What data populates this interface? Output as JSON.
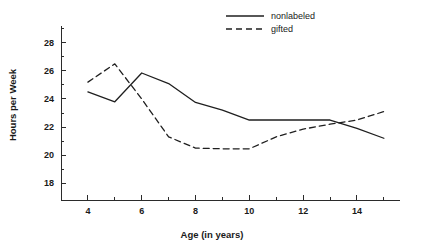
{
  "chart_data": {
    "type": "line",
    "title": "",
    "xlabel": "Age (in years)",
    "ylabel": "Hours per Week",
    "xlim": [
      3,
      15.6
    ],
    "ylim": [
      16.8,
      29.2
    ],
    "grid": false,
    "legend_position": "top-right",
    "x": [
      4,
      5,
      6,
      7,
      8,
      9,
      10,
      11,
      12,
      13,
      14,
      15
    ],
    "xticks": [
      4,
      5,
      6,
      7,
      8,
      9,
      10,
      11,
      12,
      13,
      14,
      15
    ],
    "xtick_labels": [
      "4",
      "",
      "6",
      "",
      "8",
      "",
      "10",
      "",
      "12",
      "",
      "14",
      ""
    ],
    "yticks": [
      18,
      19,
      20,
      21,
      22,
      23,
      24,
      25,
      26,
      27,
      28,
      29
    ],
    "ytick_labels": [
      "18",
      "",
      "20",
      "",
      "22",
      "",
      "24",
      "",
      "26",
      "",
      "28",
      ""
    ],
    "series": [
      {
        "name": "nonlabeled",
        "style": "solid",
        "values": [
          24.5,
          23.8,
          25.85,
          25.1,
          23.75,
          23.2,
          22.5,
          22.5,
          22.5,
          22.5,
          21.9,
          21.2
        ]
      },
      {
        "name": "gifted",
        "style": "dashed",
        "values": [
          25.2,
          26.5,
          24.0,
          21.3,
          20.5,
          20.45,
          20.45,
          21.3,
          21.85,
          22.2,
          22.5,
          23.1
        ]
      }
    ]
  },
  "legend": {
    "items": [
      {
        "label": "nonlabeled",
        "style": "solid"
      },
      {
        "label": "gifted",
        "style": "dashed"
      }
    ]
  }
}
